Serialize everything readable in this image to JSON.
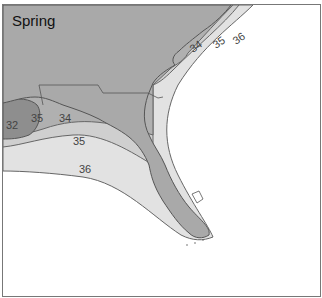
{
  "map": {
    "title": "Spring",
    "region": "Florida and Gulf/Atlantic coast",
    "colors": {
      "land": "#a9a9a9",
      "zone_lt34": "#8e8e8e",
      "zone_34_35": "#b5b5b5",
      "zone_35_36": "#e2e2e2",
      "zone_gt36": "#ffffff",
      "contour": "#555555",
      "border": "#777777"
    },
    "contours": [
      {
        "label": "32",
        "value": 32
      },
      {
        "label": "35",
        "value": 35,
        "position": "near Mississippi delta"
      },
      {
        "label": "34",
        "value": 34,
        "position": "gulf"
      },
      {
        "label": "35",
        "value": 35,
        "position": "gulf"
      },
      {
        "label": "36",
        "value": 36,
        "position": "gulf"
      },
      {
        "label": "34",
        "value": 34,
        "position": "atlantic"
      },
      {
        "label": "35",
        "value": 35,
        "position": "atlantic"
      },
      {
        "label": "36",
        "value": 36,
        "position": "atlantic"
      }
    ]
  }
}
